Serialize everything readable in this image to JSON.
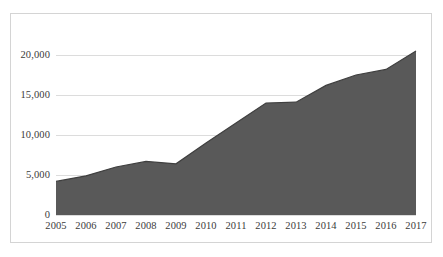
{
  "chart_data": {
    "type": "area",
    "title": "",
    "subtitle": "",
    "xlabel": "",
    "ylabel": "",
    "categories": [
      "2005",
      "2006",
      "2007",
      "2008",
      "2009",
      "2010",
      "2011",
      "2012",
      "2013",
      "2014",
      "2015",
      "2016",
      "2017"
    ],
    "values": [
      4200,
      4900,
      6000,
      6700,
      6400,
      9000,
      11500,
      14000,
      14100,
      16200,
      17500,
      18200,
      20500
    ],
    "series": [
      {
        "name": "Total",
        "values": [
          4200,
          4900,
          6000,
          6700,
          6400,
          9000,
          11500,
          14000,
          14100,
          16200,
          17500,
          18200,
          20500
        ],
        "fill_color": "#595959",
        "line_color": "#3f3f3f"
      }
    ],
    "ylim": [
      0,
      22000
    ],
    "y_ticks": [
      0,
      5000,
      10000,
      15000,
      20000
    ],
    "y_tick_labels": [
      "0",
      "5,000",
      "10,000",
      "15,000",
      "20,000"
    ],
    "x_tick_labels": [
      "2005",
      "2006",
      "2007",
      "2008",
      "2009",
      "2010",
      "2011",
      "2012",
      "2013",
      "2014",
      "2015",
      "2016",
      "2017"
    ],
    "grid": true,
    "grid_color": "#dcdcdc",
    "legend": false,
    "legend_position": "none",
    "plot_background": "#ffffff",
    "border_color": "#d4d4d4",
    "axis_text_color": "#3b3b3b",
    "annotations": []
  }
}
